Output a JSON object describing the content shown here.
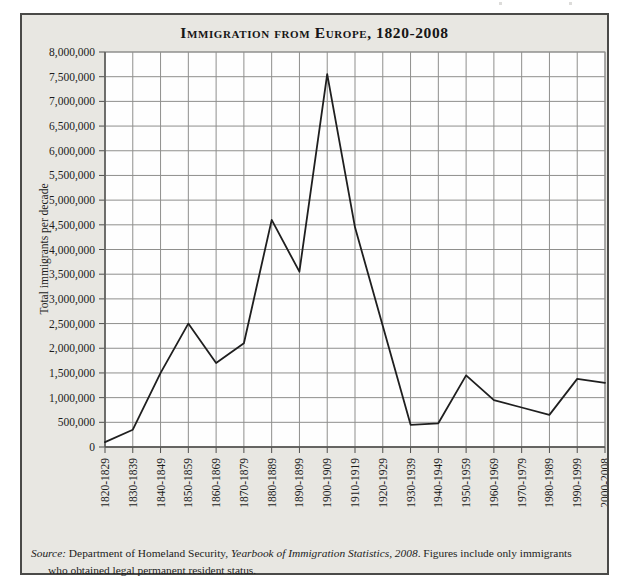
{
  "figure": {
    "title": "Immigration from Europe, 1820-2008",
    "background_color": "#e8e7e2",
    "source": {
      "prefix_italic": "Source:",
      "text_1": " Department of Homeland Security, ",
      "work_italic": "Yearbook of Immigration Statistics, 2008",
      "text_2": ". Figures include only immigrants who obtained legal permanent resident status."
    }
  },
  "chart_data": {
    "type": "line",
    "title": "Immigration from Europe, 1820-2008",
    "xlabel": "",
    "ylabel": "Total immigrants per decade",
    "categories": [
      "1820-1829",
      "1830-1839",
      "1840-1849",
      "1850-1859",
      "1860-1869",
      "1870-1879",
      "1880-1889",
      "1890-1899",
      "1900-1909",
      "1910-1919",
      "1920-1929",
      "1930-1939",
      "1940-1949",
      "1950-1959",
      "1960-1969",
      "1970-1979",
      "1980-1989",
      "1990-1999",
      "2000-2008"
    ],
    "values": [
      100000,
      350000,
      1500000,
      2500000,
      1700000,
      2100000,
      4600000,
      3550000,
      7550000,
      4450000,
      2450000,
      450000,
      480000,
      1450000,
      950000,
      800000,
      650000,
      1380000,
      1300000
    ],
    "ylim": [
      0,
      8000000
    ],
    "ytick_step": 500000,
    "ytick_labels": [
      "0",
      "500,000",
      "1,000,000",
      "1,500,000",
      "2,000,000",
      "2,500,000",
      "3,000,000",
      "3,500,000",
      "4,000,000",
      "4,500,000",
      "5,000,000",
      "5,500,000",
      "6,000,000",
      "6,500,000",
      "7,000,000",
      "7,500,000",
      "8,000,000"
    ],
    "xtick_rotation": -90,
    "grid": true,
    "legend": "none",
    "line_color": "#1f1f1f",
    "grid_color": "#8f8f8d",
    "axis_color": "#4f4f4d",
    "plot_background": "#fefefe"
  }
}
